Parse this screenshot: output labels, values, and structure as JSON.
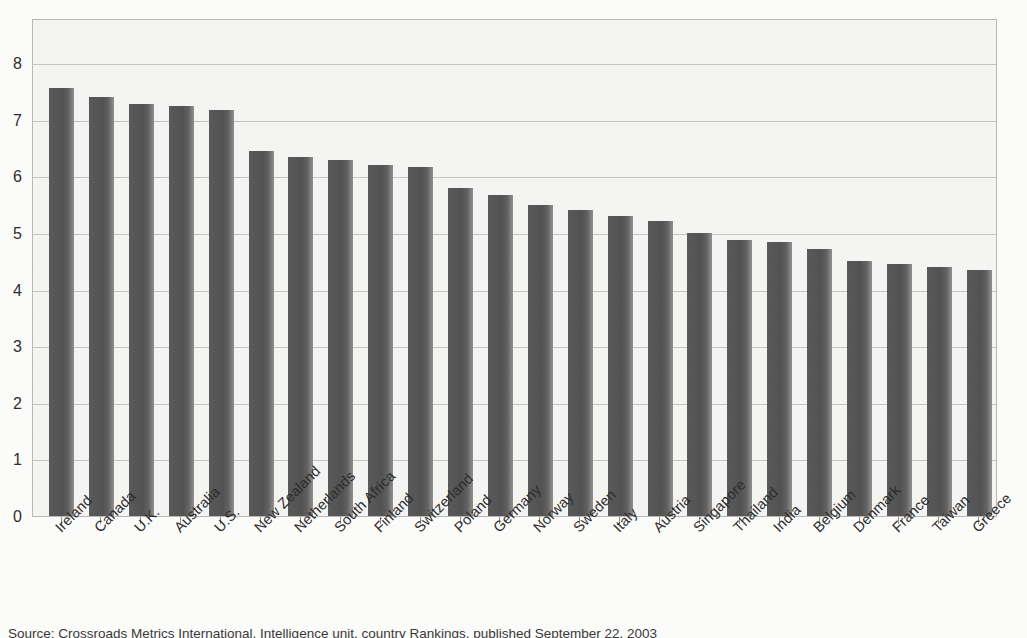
{
  "chart_data": {
    "type": "bar",
    "title": "",
    "subtitle": "",
    "xlabel": "",
    "ylabel": "",
    "ylim": [
      0,
      8.8
    ],
    "yticks": [
      0,
      1,
      2,
      3,
      4,
      5,
      6,
      7,
      8
    ],
    "ytick_labels": [
      "0",
      "1",
      "2",
      "3",
      "4",
      "5",
      "6",
      "7",
      "8"
    ],
    "grid": true,
    "legend": null,
    "legend_position": "none",
    "orientation": "vertical",
    "bar_color": "#5a5a5a",
    "plot_background": "#f6f6f4",
    "gridline_color": "#bdbdbb",
    "categories": [
      "Ireland",
      "Canada",
      "U.K.",
      "Australia",
      "U.S.",
      "New Zealand",
      "Netherlands",
      "South Africa",
      "Finland",
      "Switzerland",
      "Poland",
      "Germany",
      "Norway",
      "Sweden",
      "Italy",
      "Austria",
      "Singapore",
      "Thailand",
      "India",
      "Belgium",
      "Denmark",
      "France",
      "Taiwan",
      "Greece"
    ],
    "values": [
      7.57,
      7.41,
      7.28,
      7.24,
      7.18,
      6.45,
      6.35,
      6.29,
      6.2,
      6.16,
      5.8,
      5.68,
      5.5,
      5.41,
      5.31,
      5.22,
      5.0,
      4.87,
      4.85,
      4.72,
      4.5,
      4.45,
      4.4,
      4.35
    ]
  },
  "caption": {
    "source": "Source: Crossroads Metrics International, Intelligence unit, country Rankings, published September 22, 2003"
  }
}
